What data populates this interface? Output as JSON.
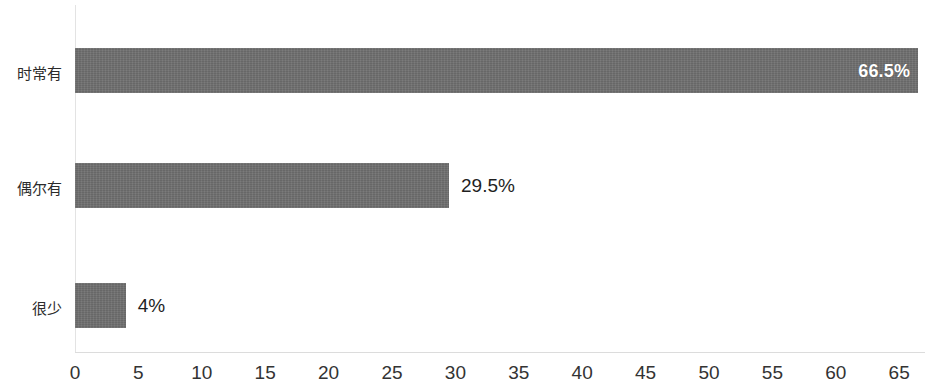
{
  "chart_data": {
    "type": "bar",
    "orientation": "horizontal",
    "title": "",
    "subtitle": "",
    "xlabel": "",
    "ylabel": "",
    "categories": [
      "时常有",
      "偶尔有",
      "很少"
    ],
    "values": [
      66.5,
      29.5,
      4
    ],
    "data_labels": [
      "66.5%",
      "29.5%",
      "4%"
    ],
    "xlim": [
      0,
      65
    ],
    "xticks": [
      0,
      5,
      10,
      15,
      20,
      25,
      30,
      35,
      40,
      45,
      50,
      55,
      60,
      65
    ],
    "xtick_labels": [
      "0",
      "5",
      "10",
      "15",
      "20",
      "25",
      "30",
      "35",
      "40",
      "45",
      "50",
      "55",
      "60",
      "65"
    ],
    "grid": false,
    "legend": false,
    "legend_position": "none",
    "colors": {
      "bar_fill": "#6e6e6e",
      "background": "#ffffff",
      "axis_line": "#e0e0e0",
      "label_inside": "#ffffff",
      "label_outside": "#1f1f1f",
      "tick_text": "#333333"
    }
  },
  "bars": [
    {
      "category": "时常有",
      "value": 66.5,
      "label": "66.5%",
      "label_position": "inside"
    },
    {
      "category": "偶尔有",
      "value": 29.5,
      "label": "29.5%",
      "label_position": "outside"
    },
    {
      "category": "很少",
      "value": 4,
      "label": "4%",
      "label_position": "outside"
    }
  ],
  "axis": {
    "x_ticks": [
      {
        "value": 0,
        "label": "0"
      },
      {
        "value": 5,
        "label": "5"
      },
      {
        "value": 10,
        "label": "10"
      },
      {
        "value": 15,
        "label": "15"
      },
      {
        "value": 20,
        "label": "20"
      },
      {
        "value": 25,
        "label": "25"
      },
      {
        "value": 30,
        "label": "30"
      },
      {
        "value": 35,
        "label": "35"
      },
      {
        "value": 40,
        "label": "40"
      },
      {
        "value": 45,
        "label": "45"
      },
      {
        "value": 50,
        "label": "50"
      },
      {
        "value": 55,
        "label": "55"
      },
      {
        "value": 60,
        "label": "60"
      },
      {
        "value": 65,
        "label": "65"
      }
    ]
  }
}
